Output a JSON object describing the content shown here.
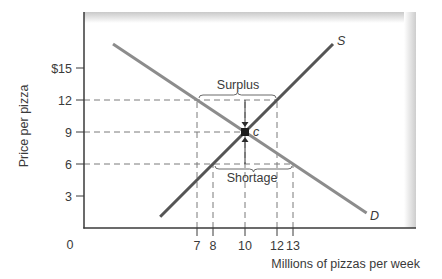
{
  "chart_data": {
    "type": "line",
    "title": "",
    "xlabel": "Millions of pizzas per week",
    "ylabel": "Price per pizza",
    "xlim": [
      0,
      20.7
    ],
    "ylim": [
      0,
      20
    ],
    "x_ticks": [
      7,
      8,
      10,
      12,
      13
    ],
    "x_tick_labels": [
      "7",
      "8",
      "10",
      "12",
      "13"
    ],
    "y_ticks": [
      3,
      6,
      9,
      12,
      15
    ],
    "y_tick_labels": [
      "3",
      "6",
      "9",
      "12",
      "$15"
    ],
    "origin_label": "0",
    "grid": false,
    "legend": null,
    "series": [
      {
        "name": "D",
        "label": "D",
        "kind": "demand",
        "color": "#8c8c8c",
        "points": [
          [
            1.75,
            17.25
          ],
          [
            7,
            12
          ],
          [
            10,
            9
          ],
          [
            13,
            6
          ],
          [
            17.6,
            1.4
          ]
        ]
      },
      {
        "name": "S",
        "label": "S",
        "kind": "supply",
        "color": "#555555",
        "points": [
          [
            4.7,
            1.05
          ],
          [
            8,
            6
          ],
          [
            10,
            9
          ],
          [
            12,
            12
          ],
          [
            15.5,
            17.25
          ]
        ]
      }
    ],
    "equilibrium": {
      "label": "c",
      "x": 10,
      "y": 9
    },
    "reference_lines": [
      {
        "type": "horizontal",
        "y": 12,
        "x_to": 12
      },
      {
        "type": "horizontal",
        "y": 9,
        "x_to": 10
      },
      {
        "type": "horizontal",
        "y": 6,
        "x_to": 13
      },
      {
        "type": "vertical",
        "x": 7,
        "y_to": 12
      },
      {
        "type": "vertical",
        "x": 8,
        "y_to": 6
      },
      {
        "type": "vertical",
        "x": 10,
        "y_to": 12
      },
      {
        "type": "vertical",
        "x": 12,
        "y_to": 12
      },
      {
        "type": "vertical",
        "x": 13,
        "y_to": 6
      }
    ],
    "annotations": [
      {
        "text": "Surplus",
        "price": 12,
        "from_x": 7,
        "to_x": 12,
        "brace": "above"
      },
      {
        "text": "Shortage",
        "price": 6,
        "from_x": 8,
        "to_x": 13,
        "brace": "below"
      }
    ],
    "arrows": [
      {
        "from": [
          10,
          12
        ],
        "to": [
          10,
          9
        ],
        "description": "price falls from surplus toward equilibrium"
      },
      {
        "from": [
          10,
          6
        ],
        "to": [
          10,
          9
        ],
        "description": "price rises from shortage toward equilibrium"
      }
    ]
  },
  "labels": {
    "y_axis": "Price per pizza",
    "x_axis": "Millions of pizzas per week",
    "surplus": "Surplus",
    "shortage": "Shortage",
    "supply": "S",
    "demand": "D",
    "equilibrium": "c",
    "origin": "0"
  },
  "colors": {
    "axis": "#3a3a3a",
    "dashed": "#7a7a7a",
    "demand": "#8c8c8c",
    "supply": "#555555",
    "frame_shadow": "#cfcfcf"
  }
}
